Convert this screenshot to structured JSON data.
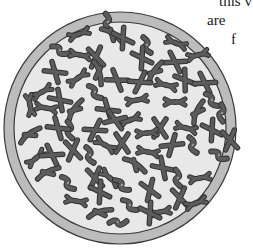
{
  "figure": {
    "colors": {
      "ring_fill": "#bcbcbc",
      "ring_outline": "#3a3a3a",
      "interior_fill": "#e8e8e8",
      "chromosome_fill": "#5c5c5c",
      "chromosome_outline": "#333333",
      "chromosome_highlight": "#8a8a8a"
    }
  },
  "caption": {
    "lines": [
      "this v",
      "are",
      "f"
    ]
  }
}
